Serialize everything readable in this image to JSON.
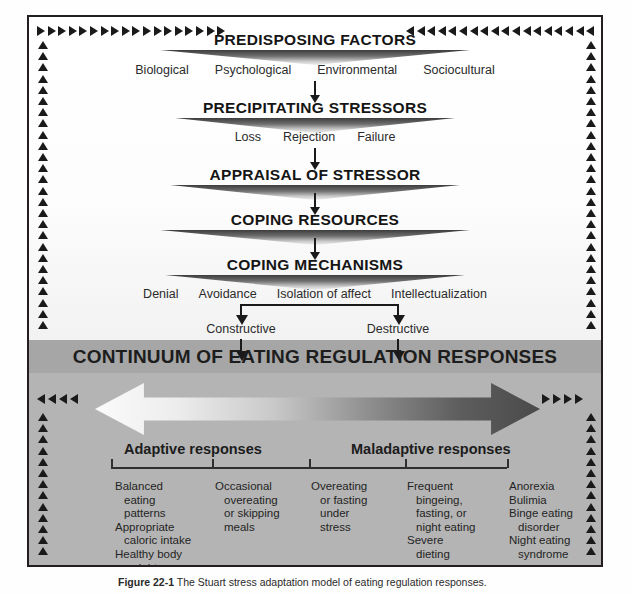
{
  "figure": {
    "caption_label": "Figure 22-1",
    "caption_text": "The Stuart stress adaptation model of eating regulation responses."
  },
  "flow": {
    "stages": [
      {
        "title": "PREDISPOSING FACTORS",
        "terms": [
          "Biological",
          "Psychological",
          "Environmental",
          "Sociocultural"
        ]
      },
      {
        "title": "PRECIPITATING STRESSORS",
        "terms": [
          "Loss",
          "Rejection",
          "Failure"
        ]
      },
      {
        "title": "APPRAISAL OF STRESSOR",
        "terms": []
      },
      {
        "title": "COPING RESOURCES",
        "terms": []
      },
      {
        "title": "COPING MECHANISMS",
        "terms": [
          "Denial",
          "Avoidance",
          "Isolation of affect",
          "Intellectualization"
        ]
      }
    ],
    "branch": {
      "left_label": "Constructive",
      "right_label": "Destructive"
    }
  },
  "continuum": {
    "title": "CONTINUUM OF EATING REGULATION RESPONSES",
    "left_pole": "Adaptive responses",
    "right_pole": "Maladaptive responses",
    "columns": [
      {
        "lines": [
          "Balanced",
          "eating",
          "patterns",
          "Appropriate",
          "caloric intake",
          "Healthy body",
          "weight"
        ],
        "indent": [
          false,
          true,
          true,
          false,
          true,
          false,
          true
        ]
      },
      {
        "lines": [
          "Occasional",
          "overeating",
          "or skipping",
          "meals"
        ],
        "indent": [
          false,
          true,
          true,
          true
        ]
      },
      {
        "lines": [
          "Overeating",
          "or fasting",
          "under",
          "stress"
        ],
        "indent": [
          false,
          true,
          true,
          true
        ]
      },
      {
        "lines": [
          "Frequent",
          "bingeing,",
          "fasting, or",
          "night eating",
          "Severe",
          "dieting"
        ],
        "indent": [
          false,
          true,
          true,
          true,
          false,
          true
        ]
      },
      {
        "lines": [
          "Anorexia",
          "Bulimia",
          "Binge eating",
          "disorder",
          "Night eating",
          "syndrome"
        ],
        "indent": [
          false,
          false,
          false,
          true,
          false,
          true
        ]
      }
    ]
  },
  "colors": {
    "band": "#a6a6a6",
    "panel_bottom": "#b4b4b4",
    "panel_top": "#ffffff",
    "ink": "#1a1a1a",
    "arrow_light": "#fbfbfb",
    "arrow_dark": "#4a4a4a"
  },
  "icons": {
    "border_top_left": "triangle-right-icon",
    "border_top_right": "triangle-left-icon",
    "border_side": "triangle-up-icon",
    "band_left": "triangle-left-icon",
    "band_right": "triangle-right-icon",
    "connector": "arrow-down-icon",
    "continuum": "double-arrow-icon"
  }
}
